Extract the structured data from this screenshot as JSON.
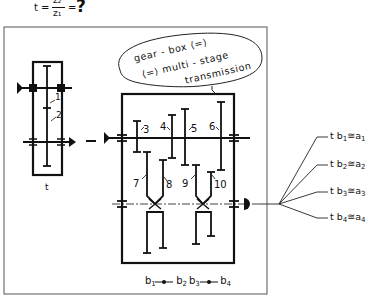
{
  "formula": {
    "lhs": "t =",
    "numerator": "z₂",
    "denominator": "z₁",
    "eq": "=",
    "result": "?"
  },
  "bubble": {
    "line1": "gear - box  ⟨=⟩",
    "line2": "⟨=⟩  multi - stage",
    "line3": "transmission"
  },
  "left_gearbox": {
    "label": "t",
    "gears": [
      {
        "id": "1",
        "label": "1"
      },
      {
        "id": "2",
        "label": "2"
      }
    ]
  },
  "right_gearbox": {
    "gears": [
      {
        "id": "3",
        "label": "3"
      },
      {
        "id": "4",
        "label": "4"
      },
      {
        "id": "5",
        "label": "5"
      },
      {
        "id": "6",
        "label": "6"
      },
      {
        "id": "7",
        "label": "7"
      },
      {
        "id": "8",
        "label": "8"
      },
      {
        "id": "9",
        "label": "9"
      },
      {
        "id": "10",
        "label": "10"
      }
    ],
    "shift_groups": [
      {
        "left": "b",
        "left_sub": "1",
        "right": "b",
        "right_sub": "2"
      },
      {
        "left": "b",
        "left_sub": "3",
        "right": "b",
        "right_sub": "4"
      }
    ]
  },
  "outputs": [
    {
      "prefix": "t b",
      "sub": "1",
      "rel": "≅",
      "rhs": "a",
      "rhs_sub": "1"
    },
    {
      "prefix": "t b",
      "sub": "2",
      "rel": "≅",
      "rhs": "a",
      "rhs_sub": "2"
    },
    {
      "prefix": "t b",
      "sub": "3",
      "rel": "≅",
      "rhs": "a",
      "rhs_sub": "3"
    },
    {
      "prefix": "t b",
      "sub": "4",
      "rel": "≅",
      "rhs": "a",
      "rhs_sub": "4"
    }
  ]
}
